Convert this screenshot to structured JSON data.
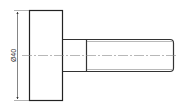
{
  "drawing": {
    "type": "technical-drawing",
    "subject": "headed shaft / bolt side view",
    "colors": {
      "outline": "#222222",
      "thin_line": "#555555",
      "center_line": "#777777",
      "background": "#ffffff"
    },
    "dimensions": [
      {
        "label": "Ø40",
        "target": "head-diameter",
        "orientation": "vertical"
      }
    ]
  }
}
